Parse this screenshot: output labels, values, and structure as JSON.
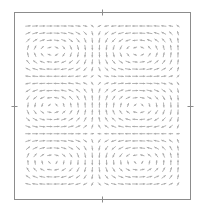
{
  "chart_data": {
    "type": "quiver",
    "title": "",
    "xlabel": "",
    "ylabel": "",
    "grid": false,
    "legend": null,
    "frame": {
      "x": 14,
      "y": 12,
      "width": 176,
      "height": 187,
      "color": "#8c8c8c"
    },
    "ticks": {
      "top": [
        102
      ],
      "bottom": [
        102
      ],
      "left": [
        106
      ],
      "right": [
        106
      ],
      "labels": []
    },
    "arrow_color": "#a9a9a9",
    "arrow_grid": {
      "x_start": 28,
      "x_end": 178,
      "cols": 22,
      "y_start": 26,
      "y_end": 184,
      "rows": 23,
      "arrow_length": 5.2
    },
    "field": {
      "description": "Periodic cellular vortex flow (rotating cells)",
      "vortex_centers_px": [
        {
          "x": 138,
          "y": 52,
          "rotation": "counterclockwise"
        },
        {
          "x": 52,
          "y": 106,
          "rotation": "clockwise"
        },
        {
          "x": 138,
          "y": 162,
          "rotation": "counterclockwise"
        }
      ],
      "saddle_regions_px": [
        {
          "x": 62,
          "y": 38
        },
        {
          "x": 100,
          "y": 106
        },
        {
          "x": 62,
          "y": 176
        }
      ]
    }
  }
}
